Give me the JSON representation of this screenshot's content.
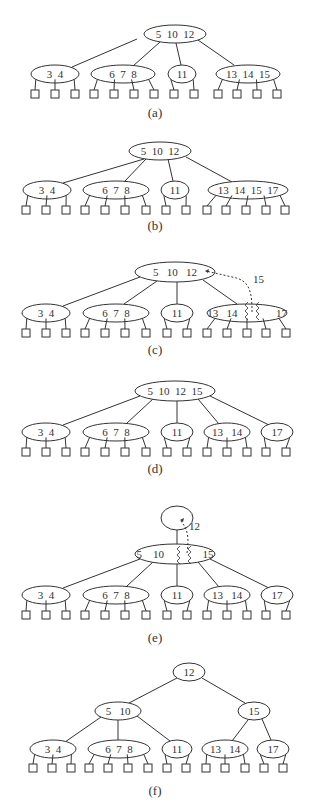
{
  "colors": {
    "stroke": "#333333",
    "text": "#333333",
    "background": "#ffffff"
  },
  "panels": [
    {
      "label": "(a)",
      "label_y": 117,
      "nodes": [
        {
          "id": "a-root",
          "text": "5  10  12",
          "cx": 175,
          "cy": 34,
          "rx": 31,
          "ry": 9
        },
        {
          "id": "a-n1",
          "text": "3  4",
          "cx": 55,
          "cy": 74,
          "rx": 24,
          "ry": 9
        },
        {
          "id": "a-n2",
          "text": "6  7  8",
          "cx": 123,
          "cy": 74,
          "rx": 32,
          "ry": 9
        },
        {
          "id": "a-n3",
          "text": "11",
          "cx": 182,
          "cy": 74,
          "rx": 14,
          "ry": 9
        },
        {
          "id": "a-n4",
          "text": "13  14  15",
          "cx": 248,
          "cy": 74,
          "rx": 32,
          "ry": 9
        }
      ],
      "edges": [
        {
          "from": [
            137,
            39
          ],
          "to": [
            72,
            67
          ]
        },
        {
          "from": [
            160,
            42
          ],
          "to": [
            133,
            66
          ]
        },
        {
          "from": [
            176,
            43
          ],
          "to": [
            181,
            65
          ]
        },
        {
          "from": [
            198,
            40
          ],
          "to": [
            234,
            65
          ]
        }
      ],
      "leaves": [
        {
          "parent": "a-n1",
          "xs": [
            35,
            55,
            75
          ]
        },
        {
          "parent": "a-n2",
          "xs": [
            94,
            114,
            134,
            154
          ]
        },
        {
          "parent": "a-n3",
          "xs": [
            174,
            194
          ]
        },
        {
          "parent": "a-n4",
          "xs": [
            218,
            237,
            257,
            277
          ]
        }
      ],
      "leaf_y": 94
    },
    {
      "label": "(b)",
      "label_y": 230,
      "nodes": [
        {
          "id": "b-root",
          "text": "5  10  12",
          "cx": 160,
          "cy": 151,
          "rx": 31,
          "ry": 9
        },
        {
          "id": "b-n1",
          "text": "3  4",
          "cx": 47,
          "cy": 190,
          "rx": 24,
          "ry": 9
        },
        {
          "id": "b-n2",
          "text": "6  7  8",
          "cx": 116,
          "cy": 190,
          "rx": 33,
          "ry": 9
        },
        {
          "id": "b-n3",
          "text": "11",
          "cx": 175,
          "cy": 190,
          "rx": 14,
          "ry": 9
        },
        {
          "id": "b-n4",
          "text": "13  14  15  17",
          "cx": 248,
          "cy": 190,
          "rx": 40,
          "ry": 9
        }
      ],
      "edges": [
        {
          "from": [
            144,
            159
          ],
          "to": [
            63,
            183
          ]
        },
        {
          "from": [
            146,
            159
          ],
          "to": [
            124,
            182
          ]
        },
        {
          "from": [
            168,
            159
          ],
          "to": [
            173,
            181
          ]
        },
        {
          "from": [
            186,
            157
          ],
          "to": [
            232,
            182
          ]
        }
      ],
      "leaves": [
        {
          "parent": "b-n1",
          "xs": [
            26,
            46,
            66
          ]
        },
        {
          "parent": "b-n2",
          "xs": [
            85,
            105,
            125,
            146
          ]
        },
        {
          "parent": "b-n3",
          "xs": [
            166,
            186
          ]
        },
        {
          "parent": "b-n4",
          "xs": [
            207,
            226,
            246,
            266,
            285
          ]
        }
      ],
      "leaf_y": 210
    },
    {
      "label": "(c)",
      "label_y": 354,
      "nodes": [
        {
          "id": "c-root",
          "text": "5   10   12",
          "cx": 175,
          "cy": 272,
          "rx": 40,
          "ry": 10
        },
        {
          "id": "c-n1",
          "text": "3  4",
          "cx": 46,
          "cy": 313,
          "rx": 24,
          "ry": 9
        },
        {
          "id": "c-n2",
          "text": "6  7  8",
          "cx": 116,
          "cy": 313,
          "rx": 33,
          "ry": 9
        },
        {
          "id": "c-n3",
          "text": "11",
          "cx": 177,
          "cy": 313,
          "rx": 16,
          "ry": 9
        },
        {
          "id": "c-n4",
          "text": "13   14              17",
          "cx": 247,
          "cy": 313,
          "rx": 40,
          "ry": 9
        }
      ],
      "edges": [
        {
          "from": [
            140,
            277
          ],
          "to": [
            63,
            306
          ]
        },
        {
          "from": [
            157,
            281
          ],
          "to": [
            124,
            304
          ]
        },
        {
          "from": [
            177,
            282
          ],
          "to": [
            177,
            304
          ]
        },
        {
          "from": [
            203,
            280
          ],
          "to": [
            237,
            304
          ]
        }
      ],
      "leaves": [
        {
          "parent": "c-n1",
          "xs": [
            26,
            46,
            66
          ]
        },
        {
          "parent": "c-n2",
          "xs": [
            85,
            105,
            125,
            146
          ]
        },
        {
          "parent": "c-n3",
          "xs": [
            167,
            187
          ]
        },
        {
          "parent": "c-n4",
          "xs": [
            207,
            227,
            247,
            266,
            286
          ]
        }
      ],
      "leaf_y": 333,
      "annotation": {
        "text": "15",
        "x": 253,
        "y": 283
      },
      "promote_path": "M 252 312 C 252 292, 250 280, 232 277 L 206 271",
      "arrow_tip": [
        205,
        271
      ],
      "split_zig": [
        "M 248 302 l -3 3 l 3 3 l -3 3 l 3 3 l -3 3 l 3 3",
        "M 259 302 l -3 3 l 3 3 l -3 3 l 3 3 l -3 3 l 3 3"
      ]
    },
    {
      "label": "(d)",
      "label_y": 473,
      "nodes": [
        {
          "id": "d-root",
          "text": "5  10  12  15",
          "cx": 175,
          "cy": 391,
          "rx": 40,
          "ry": 10
        },
        {
          "id": "d-n1",
          "text": "3  4",
          "cx": 46,
          "cy": 432,
          "rx": 24,
          "ry": 9
        },
        {
          "id": "d-n2",
          "text": "6  7  8",
          "cx": 116,
          "cy": 432,
          "rx": 33,
          "ry": 9
        },
        {
          "id": "d-n3",
          "text": "11",
          "cx": 177,
          "cy": 432,
          "rx": 16,
          "ry": 9
        },
        {
          "id": "d-n4",
          "text": "13   14",
          "cx": 227,
          "cy": 432,
          "rx": 23,
          "ry": 9
        },
        {
          "id": "d-n5",
          "text": "17",
          "cx": 277,
          "cy": 432,
          "rx": 16,
          "ry": 9
        }
      ],
      "edges": [
        {
          "from": [
            140,
            396
          ],
          "to": [
            63,
            425
          ]
        },
        {
          "from": [
            153,
            399
          ],
          "to": [
            127,
            423
          ]
        },
        {
          "from": [
            177,
            401
          ],
          "to": [
            177,
            423
          ]
        },
        {
          "from": [
            198,
            399
          ],
          "to": [
            219,
            424
          ]
        },
        {
          "from": [
            210,
            396
          ],
          "to": [
            269,
            425
          ]
        }
      ],
      "leaves": [
        {
          "parent": "d-n1",
          "xs": [
            26,
            46,
            66
          ]
        },
        {
          "parent": "d-n2",
          "xs": [
            85,
            105,
            125,
            146
          ]
        },
        {
          "parent": "d-n3",
          "xs": [
            167,
            187
          ]
        },
        {
          "parent": "d-n4",
          "xs": [
            207,
            227,
            247
          ]
        },
        {
          "parent": "d-n5",
          "xs": [
            266,
            286
          ]
        }
      ],
      "leaf_y": 452
    },
    {
      "label": "(e)",
      "label_y": 642,
      "nodes": [
        {
          "id": "e-top",
          "text": "",
          "cx": 177,
          "cy": 518,
          "rx": 16,
          "ry": 12
        },
        {
          "id": "e-mid",
          "text": "5    10              15",
          "cx": 175,
          "cy": 554,
          "rx": 40,
          "ry": 10
        },
        {
          "id": "e-n1",
          "text": "3  4",
          "cx": 46,
          "cy": 595,
          "rx": 24,
          "ry": 9
        },
        {
          "id": "e-n2",
          "text": "6  7  8",
          "cx": 116,
          "cy": 595,
          "rx": 33,
          "ry": 9
        },
        {
          "id": "e-n3",
          "text": "11",
          "cx": 177,
          "cy": 595,
          "rx": 16,
          "ry": 9
        },
        {
          "id": "e-n4",
          "text": "13   14",
          "cx": 227,
          "cy": 595,
          "rx": 23,
          "ry": 9
        },
        {
          "id": "e-n5",
          "text": "17",
          "cx": 277,
          "cy": 595,
          "rx": 16,
          "ry": 9
        }
      ],
      "edges": [
        {
          "from": [
            177,
            530
          ],
          "to": [
            177,
            544
          ]
        },
        {
          "from": [
            140,
            559
          ],
          "to": [
            63,
            588
          ]
        },
        {
          "from": [
            153,
            562
          ],
          "to": [
            127,
            586
          ]
        },
        {
          "from": [
            177,
            564
          ],
          "to": [
            177,
            586
          ]
        },
        {
          "from": [
            198,
            562
          ],
          "to": [
            219,
            587
          ]
        },
        {
          "from": [
            210,
            559
          ],
          "to": [
            269,
            588
          ]
        }
      ],
      "leaves": [
        {
          "parent": "e-n1",
          "xs": [
            26,
            46,
            66
          ]
        },
        {
          "parent": "e-n2",
          "xs": [
            85,
            105,
            125,
            146
          ]
        },
        {
          "parent": "e-n3",
          "xs": [
            167,
            187
          ]
        },
        {
          "parent": "e-n4",
          "xs": [
            207,
            227,
            247
          ]
        },
        {
          "parent": "e-n5",
          "xs": [
            266,
            286
          ]
        }
      ],
      "leaf_y": 615,
      "annotation": {
        "text": "12",
        "x": 189,
        "y": 530
      },
      "promote_path": "M 187 553 C 189 540, 188 530, 183 524 L 181 521",
      "arrow_tip": [
        180,
        520
      ],
      "split_zig": [
        "M 180 546 l -3 3 l 3 3 l -3 3 l 3 3 l -3 3 l 3 3",
        "M 191 546 l -3 3 l 3 3 l -3 3 l 3 3 l -3 3 l 3 3"
      ]
    },
    {
      "label": "(f)",
      "label_y": 795,
      "nodes": [
        {
          "id": "f-root",
          "text": "12",
          "cx": 189,
          "cy": 672,
          "rx": 16,
          "ry": 9
        },
        {
          "id": "f-l",
          "text": "5   10",
          "cx": 118,
          "cy": 711,
          "rx": 23,
          "ry": 9
        },
        {
          "id": "f-r",
          "text": "15",
          "cx": 254,
          "cy": 711,
          "rx": 16,
          "ry": 9
        },
        {
          "id": "f-n1",
          "text": "3  4",
          "cx": 53,
          "cy": 749,
          "rx": 23,
          "ry": 9
        },
        {
          "id": "f-n2",
          "text": "6  7  8",
          "cx": 119,
          "cy": 749,
          "rx": 31,
          "ry": 9
        },
        {
          "id": "f-n3",
          "text": "11",
          "cx": 177,
          "cy": 749,
          "rx": 15,
          "ry": 9
        },
        {
          "id": "f-n4",
          "text": "13   14",
          "cx": 225,
          "cy": 749,
          "rx": 23,
          "ry": 9
        },
        {
          "id": "f-n5",
          "text": "17",
          "cx": 273,
          "cy": 749,
          "rx": 16,
          "ry": 9
        }
      ],
      "edges": [
        {
          "from": [
            177,
            678
          ],
          "to": [
            129,
            703
          ]
        },
        {
          "from": [
            202,
            678
          ],
          "to": [
            245,
            703
          ]
        },
        {
          "from": [
            101,
            717
          ],
          "to": [
            65,
            742
          ]
        },
        {
          "from": [
            118,
            720
          ],
          "to": [
            118,
            740
          ]
        },
        {
          "from": [
            137,
            716
          ],
          "to": [
            170,
            741
          ]
        },
        {
          "from": [
            248,
            720
          ],
          "to": [
            232,
            741
          ]
        },
        {
          "from": [
            262,
            719
          ],
          "to": [
            271,
            740
          ]
        }
      ],
      "leaves": [
        {
          "parent": "f-n1",
          "xs": [
            33,
            52,
            71
          ]
        },
        {
          "parent": "f-n2",
          "xs": [
            89,
            108,
            128,
            148
          ]
        },
        {
          "parent": "f-n3",
          "xs": [
            167,
            186
          ]
        },
        {
          "parent": "f-n4",
          "xs": [
            206,
            225,
            245
          ]
        },
        {
          "parent": "f-n5",
          "xs": [
            264,
            283
          ]
        }
      ],
      "leaf_y": 768
    }
  ]
}
